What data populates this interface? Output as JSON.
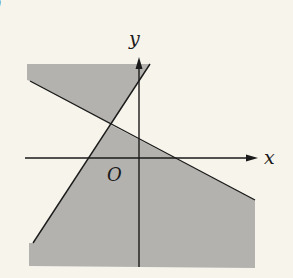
{
  "figure": {
    "corner_mark": ")",
    "axes": {
      "x_label": "x",
      "y_label": "y",
      "origin_label": "O"
    },
    "lines": [
      {
        "name": "steep-line",
        "from": [
          33,
          243
        ],
        "to": [
          150,
          64
        ]
      },
      {
        "name": "shallow-line",
        "from": [
          30,
          81
        ],
        "to": [
          255,
          200
        ]
      }
    ],
    "shaded_regions": [
      {
        "name": "upper-left-region",
        "description": "above shallow line, left of steep line"
      },
      {
        "name": "lower-right-region",
        "description": "below shallow line, right of steep line"
      }
    ],
    "colors": {
      "background": "#f7f4ec",
      "shade": "#b3b2ae",
      "ink": "#1a1a1a"
    }
  }
}
